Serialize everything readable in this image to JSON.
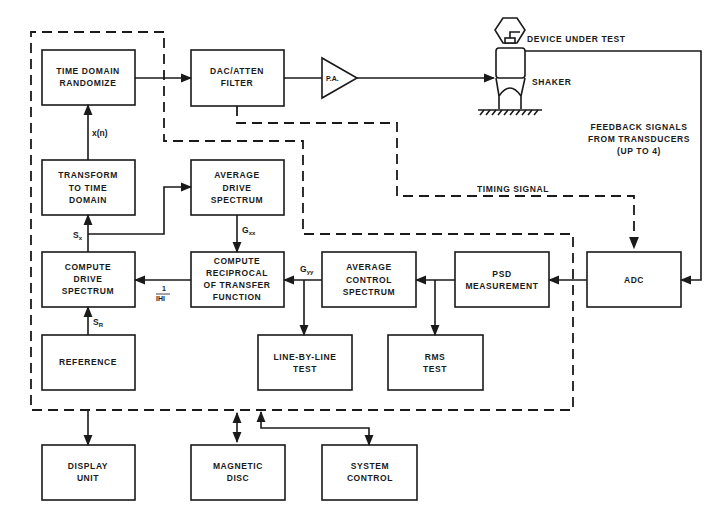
{
  "blocks": {
    "time_domain_randomize": [
      "TIME DOMAIN",
      "RANDOMIZE"
    ],
    "dac_atten_filter": [
      "DAC/ATTEN",
      "FILTER"
    ],
    "transform_to_time_domain": [
      "TRANSFORM",
      "TO TIME",
      "DOMAIN"
    ],
    "average_drive_spectrum": [
      "AVERAGE",
      "DRIVE",
      "SPECTRUM"
    ],
    "compute_drive_spectrum": [
      "COMPUTE",
      "DRIVE",
      "SPECTRUM"
    ],
    "compute_reciprocal": [
      "COMPUTE",
      "RECIPROCAL",
      "OF TRANSFER",
      "FUNCTION"
    ],
    "average_control_spectrum": [
      "AVERAGE",
      "CONTROL",
      "SPECTRUM"
    ],
    "psd_measurement": [
      "PSD",
      "MEASUREMENT"
    ],
    "adc": [
      "ADC"
    ],
    "reference": [
      "REFERENCE"
    ],
    "line_by_line_test": [
      "LINE-BY-LINE",
      "TEST"
    ],
    "rms_test": [
      "RMS",
      "TEST"
    ],
    "display_unit": [
      "DISPLAY",
      "UNIT"
    ],
    "magnetic_disc": [
      "MAGNETIC",
      "DISC"
    ],
    "system_control": [
      "SYSTEM",
      "CONTROL"
    ]
  },
  "amplifier": {
    "label": "P.A."
  },
  "device": {
    "device_label": "DEVICE UNDER TEST",
    "shaker_label": "SHAKER"
  },
  "annotations": {
    "feedback": [
      "FEEDBACK SIGNALS",
      "FROM TRANSDUCERS",
      "(UP TO 4)"
    ],
    "timing_signal": "TIMING SIGNAL"
  },
  "signals": {
    "x_of_n": "x(n)",
    "sx_main": "S",
    "sx_sub": "x",
    "gxx_main": "G",
    "gxx_sub": "xx",
    "gyy_main": "G",
    "gyy_sub": "yy",
    "sr_main": "S",
    "sr_sub": "R",
    "inv_h_num": "1",
    "inv_h_den": "IHI"
  }
}
